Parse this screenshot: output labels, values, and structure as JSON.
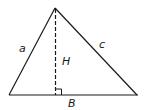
{
  "diagram": {
    "type": "triangle-with-altitude",
    "labels": {
      "side_left": "a",
      "side_right": "c",
      "height": "H",
      "base": "B"
    },
    "colors": {
      "stroke": "#1a1a1a",
      "background": "#ffffff"
    }
  }
}
